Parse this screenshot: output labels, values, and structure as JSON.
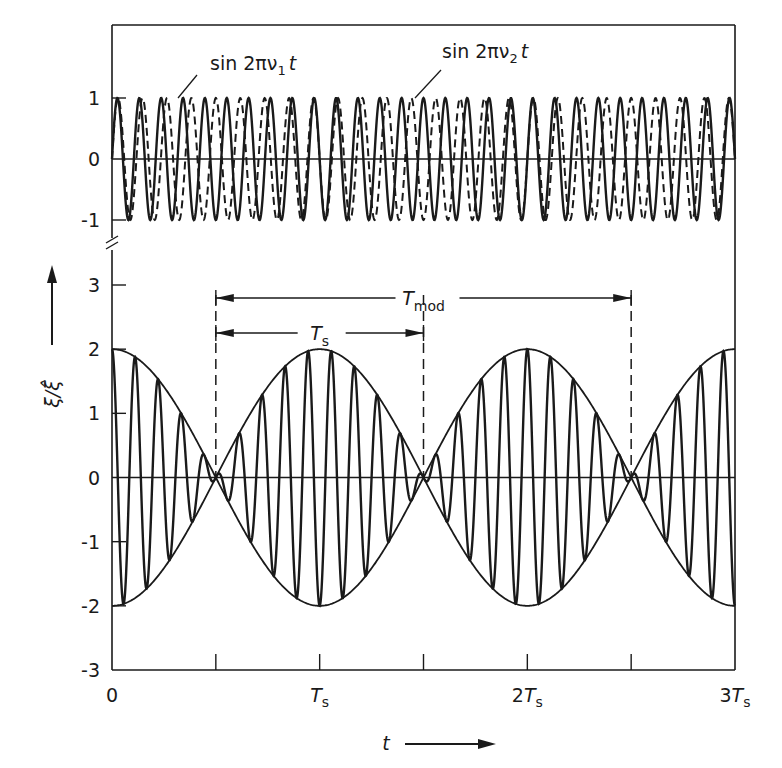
{
  "chart_data": {
    "type": "line",
    "title": "",
    "xlabel": "t",
    "ylabel": "ξ/ξ̂",
    "x_ticks": [
      {
        "value": 0,
        "label": "0"
      },
      {
        "value": 0.5,
        "label": ""
      },
      {
        "value": 1,
        "label": "T",
        "sub": "s"
      },
      {
        "value": 1.5,
        "label": ""
      },
      {
        "value": 2,
        "label": "2T",
        "sub": "s"
      },
      {
        "value": 2.5,
        "label": ""
      },
      {
        "value": 3,
        "label": "3T",
        "sub": "s"
      }
    ],
    "x_unit": "T_s",
    "xlim": [
      0,
      3
    ],
    "panels": [
      {
        "name": "upper",
        "ylim": [
          -1,
          1
        ],
        "y_ticks": [
          {
            "value": 1,
            "label": "1"
          },
          {
            "value": 0,
            "label": "0"
          },
          {
            "value": -1,
            "label": "-1"
          }
        ],
        "series": [
          {
            "name": "sin 2πν1 t",
            "label_main": "sin 2πν",
            "label_sub": "1",
            "label_tail": "t",
            "style": "solid",
            "frequency_per_Ts": 9.5,
            "amplitude": 1
          },
          {
            "name": "sin 2πν2 t",
            "label_main": "sin 2πν",
            "label_sub": "2",
            "label_tail": "t",
            "style": "dashed",
            "frequency_per_Ts": 8.5,
            "amplitude": 1
          }
        ]
      },
      {
        "name": "lower",
        "ylim": [
          -3,
          3
        ],
        "y_ticks": [
          {
            "value": 3,
            "label": "3"
          },
          {
            "value": 2,
            "label": "2"
          },
          {
            "value": 1,
            "label": "1"
          },
          {
            "value": 0,
            "label": "0"
          },
          {
            "value": -1,
            "label": "-1"
          },
          {
            "value": -2,
            "label": "-2"
          },
          {
            "value": -3,
            "label": "-3"
          }
        ],
        "series": [
          {
            "name": "sum",
            "description": "sin 2πν1 t + sin 2πν2 t",
            "style": "solid"
          },
          {
            "name": "envelope-upper",
            "description": "+2 cos(π t / T_s)",
            "style": "solid"
          },
          {
            "name": "envelope-lower",
            "description": "-2 cos(π t / T_s)",
            "style": "solid"
          }
        ],
        "dashed_markers": [
          0.5,
          1.5,
          2.5
        ],
        "annotations": [
          {
            "name": "T_mod",
            "label": "T",
            "sub": "mod",
            "from": 0.5,
            "to": 2.5
          },
          {
            "name": "T_s",
            "label": "T",
            "sub": "s",
            "from": 0.5,
            "to": 1.5
          }
        ]
      }
    ],
    "axis_break": true
  },
  "labels": {
    "ylabel_text": "ξ/ξ̂",
    "xlabel_text": "t"
  }
}
